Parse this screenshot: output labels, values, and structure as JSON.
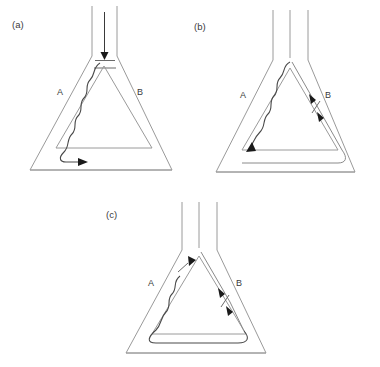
{
  "figure": {
    "background_color": "#ffffff",
    "line_color": "#9a9a9a",
    "flow_color": "#4a4a4a",
    "arrow_color": "#1a1a1a"
  },
  "panels": [
    {
      "id": "a",
      "label": "(a)",
      "zone_left_label": "A",
      "zone_right_label": "B",
      "neck": {
        "inlet_arrow": "down",
        "horizontal_marks": 2
      },
      "flow": {
        "style": "wavy",
        "side": "left",
        "terminal_arrow": "right",
        "arrow_count": 1
      }
    },
    {
      "id": "b",
      "label": "(b)",
      "zone_left_label": "A",
      "zone_right_label": "B",
      "neck": {
        "inlet_arrow": "none",
        "vertical_lines": 3,
        "horizontal_marks": 0
      },
      "flow": {
        "style": "wavy-left-and-smooth-right",
        "terminal_arrow": "down-left",
        "arrow_count": 3,
        "right_channel_ticks": 1,
        "bottom_channel": "right-to-left"
      }
    },
    {
      "id": "c",
      "label": "(c)",
      "zone_left_label": "A",
      "zone_right_label": "B",
      "neck": {
        "inlet_arrow": "none",
        "vertical_lines": 3,
        "horizontal_marks": 0
      },
      "flow": {
        "style": "wavy-left-and-smooth-right",
        "terminal_arrow": "down-right",
        "arrow_count": 3,
        "left_channel_ticks": 1,
        "right_channel_ticks": 1,
        "bottom_channel": "connected-loop"
      }
    }
  ]
}
